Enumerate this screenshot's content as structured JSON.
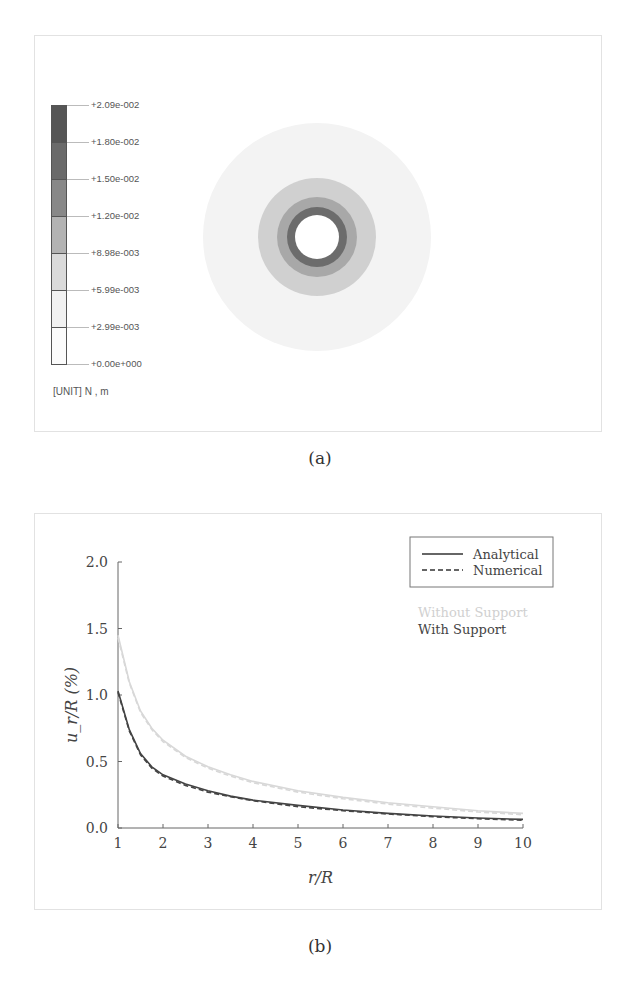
{
  "figure_a": {
    "caption": "(a)",
    "colorbar": {
      "labels": [
        "+2.09e-002",
        "+1.80e-002",
        "+1.50e-002",
        "+1.20e-002",
        "+8.98e-003",
        "+5.99e-003",
        "+2.99e-003",
        "+0.00e+000"
      ],
      "colors": [
        "#555555",
        "#6a6a6a",
        "#888888",
        "#b3b3b3",
        "#dadada",
        "#f1f1f1",
        "#fbfbfb"
      ]
    },
    "unit_label": "[UNIT] N , m",
    "contour_rings": [
      {
        "radius": 114,
        "color": "#f3f3f3"
      },
      {
        "radius": 59,
        "color": "#d0d0d0"
      },
      {
        "radius": 40,
        "color": "#a8a8a8"
      },
      {
        "radius": 30,
        "color": "#6c6c6c"
      },
      {
        "radius": 22,
        "color": "#ffffff"
      }
    ]
  },
  "figure_b": {
    "caption": "(b)",
    "legend": {
      "analytical": "Analytical",
      "numerical": "Numerical",
      "without_support": "Without Support",
      "with_support": "With Support"
    },
    "colors": {
      "with_support": "#444444",
      "without_support": "#d8d8d8"
    }
  },
  "chart_data": {
    "type": "line",
    "title": "",
    "xlabel": "r/R",
    "ylabel": "u_r/R (%)",
    "xlim": [
      1,
      10
    ],
    "ylim": [
      0,
      2.0
    ],
    "xticks": [
      "1",
      "2",
      "3",
      "4",
      "5",
      "6",
      "7",
      "8",
      "9",
      "10"
    ],
    "yticks": [
      "0.0",
      "0.5",
      "1.0",
      "1.5",
      "2.0"
    ],
    "grid": false,
    "legend_position": "upper right",
    "x": [
      1,
      1.25,
      1.5,
      1.75,
      2,
      2.5,
      3,
      3.5,
      4,
      5,
      6,
      7,
      8,
      9,
      10
    ],
    "series": [
      {
        "name": "Without Support - Analytical",
        "style": "solid",
        "color": "#d8d8d8",
        "values": [
          1.45,
          1.1,
          0.88,
          0.75,
          0.66,
          0.54,
          0.46,
          0.4,
          0.35,
          0.28,
          0.23,
          0.19,
          0.16,
          0.13,
          0.11
        ]
      },
      {
        "name": "Without Support - Numerical",
        "style": "dashed",
        "color": "#d8d8d8",
        "values": [
          1.43,
          1.09,
          0.87,
          0.74,
          0.65,
          0.53,
          0.45,
          0.39,
          0.34,
          0.27,
          0.22,
          0.18,
          0.15,
          0.12,
          0.1
        ]
      },
      {
        "name": "With Support - Analytical",
        "style": "solid",
        "color": "#444444",
        "values": [
          1.03,
          0.74,
          0.56,
          0.46,
          0.4,
          0.33,
          0.28,
          0.24,
          0.21,
          0.17,
          0.135,
          0.11,
          0.09,
          0.075,
          0.065
        ]
      },
      {
        "name": "With Support - Numerical",
        "style": "dashed",
        "color": "#444444",
        "values": [
          1.02,
          0.73,
          0.55,
          0.45,
          0.39,
          0.32,
          0.27,
          0.235,
          0.205,
          0.16,
          0.13,
          0.105,
          0.085,
          0.07,
          0.058
        ]
      }
    ]
  }
}
